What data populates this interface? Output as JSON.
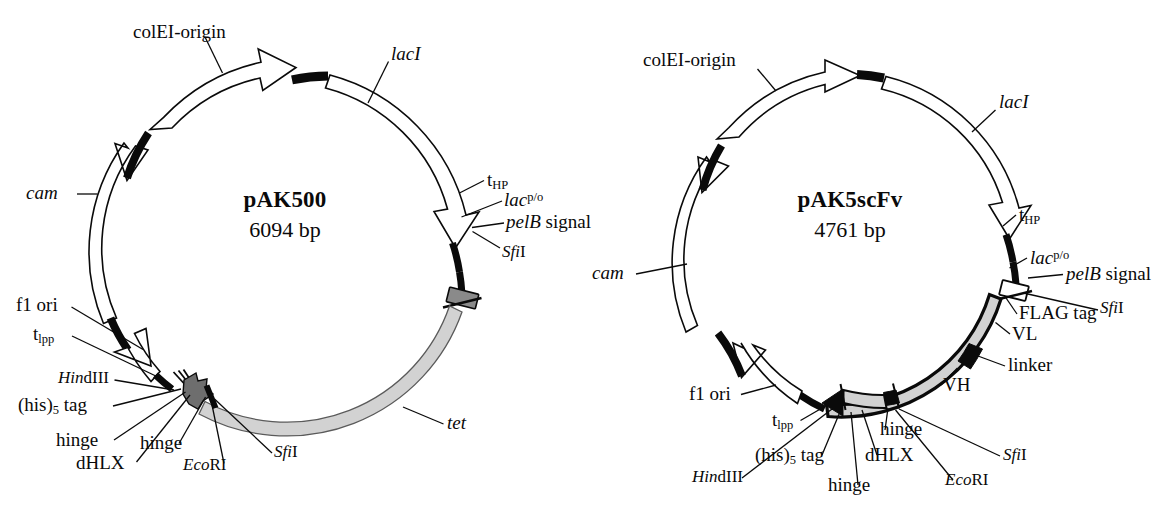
{
  "figure": {
    "kind": "plasmid-map-figure",
    "background": "#ffffff",
    "ink": "#0a0a0a",
    "fill_light_gray": "#d2d2d2",
    "fill_mid_gray": "#8a8a8a",
    "fill_white": "#ffffff"
  },
  "plasmids": [
    {
      "id": "pak500",
      "name": "pAK500",
      "size": "6094 bp",
      "center": {
        "x": 285,
        "y": 250
      },
      "radius": 172,
      "labels": {
        "colei_origin": "colEI-origin",
        "laci": "lacI",
        "t_hp": "t",
        "t_hp_sub": "HP",
        "lac_po": "lac",
        "lac_po_sup": "p/o",
        "pelb_signal_italic": "pelB",
        "pelb_signal_rest": " signal",
        "sfi1_top_i": "Sfi",
        "sfi1_top_r": "I",
        "cam": "cam",
        "tet": "tet",
        "f1_ori": "f1 ori",
        "t_lpp": "t",
        "t_lpp_sub": "lpp",
        "hindiii_i": "Hin",
        "hindiii_r": "dIII",
        "his_tag_pre": "(his)",
        "his_tag_sub": "5",
        "his_tag_post": " tag",
        "hinge_a": "hinge",
        "hinge_b": "hinge",
        "dhlx": "dHLX",
        "ecori_i": "Eco",
        "ecori_r": "RI",
        "sfi1_bot_i": "Sfi",
        "sfi1_bot_r": "I"
      }
    },
    {
      "id": "pak5scfv",
      "name": "pAK5scFv",
      "size": "4761 bp",
      "center": {
        "x": 848,
        "y": 250
      },
      "radius": 167,
      "labels": {
        "colei_origin": "colEI-origin",
        "laci": "lacI",
        "t_hp": "t",
        "t_hp_sub": "HP",
        "lac_po": "lac",
        "lac_po_sup": "p/o",
        "pelb_signal_italic": "pelB",
        "pelb_signal_rest": " signal",
        "sfi1_top_i": "Sfi",
        "sfi1_top_r": "I",
        "flag_tag": "FLAG tag",
        "vl": "VL",
        "linker": "linker",
        "vh": "VH",
        "cam": "cam",
        "f1_ori": "f1 ori",
        "t_lpp": "t",
        "t_lpp_sub": "lpp",
        "hindiii_i": "Hin",
        "hindiii_r": "dIII",
        "his_tag_pre": "(his)",
        "his_tag_sub": "5",
        "his_tag_post": " tag",
        "hinge_a": "hinge",
        "hinge_b": "hinge",
        "dhlx": "dHLX",
        "ecori_i": "Eco",
        "ecori_r": "RI",
        "sfi1_bot_i": "Sfi",
        "sfi1_bot_r": "I"
      }
    }
  ]
}
